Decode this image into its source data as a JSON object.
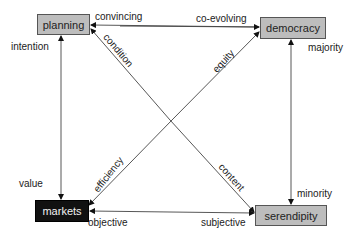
{
  "diagram": {
    "nodes": {
      "planning": {
        "label": "planning",
        "fill": "#bdbdbd"
      },
      "democracy": {
        "label": "democracy",
        "fill": "#bdbdbd"
      },
      "markets": {
        "label": "markets",
        "fill": "#111111"
      },
      "serendipity": {
        "label": "serendipity",
        "fill": "#bdbdbd"
      }
    },
    "edge_labels": {
      "convincing": "convincing",
      "co_evolving": "co-evolving",
      "condition": "condition",
      "equity": "equity",
      "intention": "intention",
      "majority": "majority",
      "value": "value",
      "efficiency": "efficiency",
      "content": "content",
      "minority": "minority",
      "objective": "objective",
      "subjective": "subjective"
    },
    "edges": [
      {
        "from": "democracy",
        "to": "planning",
        "labels": [
          "convincing",
          "co-evolving"
        ]
      },
      {
        "from": "markets",
        "to": "planning",
        "labels": [
          "intention",
          "value"
        ],
        "bidirectional": true
      },
      {
        "from": "planning",
        "to": "serendipity",
        "labels": [
          "condition",
          "content"
        ]
      },
      {
        "from": "markets",
        "to": "democracy",
        "labels": [
          "efficiency",
          "equity"
        ]
      },
      {
        "from": "serendipity",
        "to": "democracy",
        "labels": [
          "majority",
          "minority"
        ],
        "bidirectional": true
      },
      {
        "from": "serendipity",
        "to": "markets",
        "labels": [
          "objective",
          "subjective"
        ]
      }
    ]
  }
}
